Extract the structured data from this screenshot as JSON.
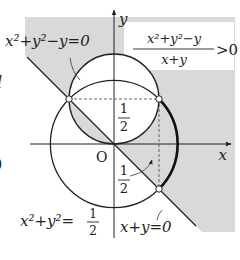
{
  "figure": {
    "type": "region-inequality-diagram",
    "colors": {
      "shade": "#d9d9d9",
      "ink": "#222222",
      "background": "#ffffff"
    },
    "axes": {
      "x_label": "x",
      "y_label": "y",
      "origin_label": "O",
      "half_tick_label_num": "1",
      "half_tick_label_den": "2",
      "half_value": 0.5
    },
    "curves": {
      "small_circle": {
        "equation": "x²+y²−y=0",
        "center": [
          0,
          0.5
        ],
        "radius": 0.5
      },
      "large_circle": {
        "equation_lhs": "x²+y²=",
        "rhs_num": "1",
        "rhs_den": "2",
        "center": [
          0,
          0
        ],
        "radius_squared": 0.5
      },
      "line": {
        "equation": "x+y=0"
      }
    },
    "inequality": {
      "numerator": "x²+y²−y",
      "denominator": "x+y",
      "relation": ">0"
    },
    "points": [
      {
        "name": "left-intersection",
        "coords": [
          -0.5,
          0.5
        ],
        "open": true
      },
      {
        "name": "right-intersection",
        "coords": [
          0.5,
          0.5
        ],
        "open": true
      },
      {
        "name": "lower-intersection",
        "coords": [
          0.5,
          -0.5
        ],
        "open": true
      }
    ],
    "edge_fragments": {
      "left_top": "l",
      "left_bottom": "0"
    }
  }
}
